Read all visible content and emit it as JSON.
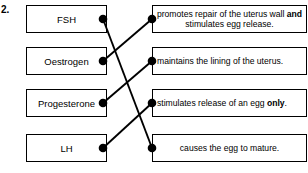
{
  "question": {
    "number": "2."
  },
  "left_boxes": [
    {
      "label": "FSH"
    },
    {
      "label": "Oestrogen"
    },
    {
      "label": "Progesterone"
    },
    {
      "label": "LH"
    }
  ],
  "right_boxes": [
    {
      "label_part1": "promotes repair of the uterus wall",
      "bold": "and",
      "label_part2": "stimulates egg release.",
      "align": "center"
    },
    {
      "label_part1": "maintains the lining of the uterus.",
      "bold": "",
      "label_part2": "",
      "align": "left"
    },
    {
      "label_part1": "stimulates release of an egg",
      "bold": "only",
      "label_part2": ".",
      "align": "left"
    },
    {
      "label_part1": "causes the egg to mature.",
      "bold": "",
      "label_part2": "",
      "align": "center"
    }
  ],
  "connections": [
    {
      "from": "FSH",
      "to": "causes the egg to mature.",
      "x1": 103,
      "y1": 19,
      "x2": 152,
      "y2": 148
    },
    {
      "from": "Oestrogen",
      "to": "promotes repair of the uterus wall and stimulates egg release.",
      "x1": 103,
      "y1": 61,
      "x2": 152,
      "y2": 19
    },
    {
      "from": "Progesterone",
      "to": "maintains the lining of the uterus.",
      "x1": 103,
      "y1": 103,
      "x2": 152,
      "y2": 61
    },
    {
      "from": "LH",
      "to": "stimulates release of an egg only.",
      "x1": 103,
      "y1": 148,
      "x2": 152,
      "y2": 103
    }
  ],
  "nodes": [
    {
      "name": "fsh-connector-dot",
      "cx": 103,
      "cy": 19
    },
    {
      "name": "oestrogen-connector-dot",
      "cx": 103,
      "cy": 61
    },
    {
      "name": "progesterone-connector-dot",
      "cx": 103,
      "cy": 103
    },
    {
      "name": "lh-connector-dot",
      "cx": 103,
      "cy": 148
    },
    {
      "name": "uterus-wall-repair-connector-dot",
      "cx": 152,
      "cy": 19
    },
    {
      "name": "maintains-lining-connector-dot",
      "cx": 152,
      "cy": 61
    },
    {
      "name": "egg-release-only-connector-dot",
      "cx": 152,
      "cy": 103
    },
    {
      "name": "egg-mature-connector-dot",
      "cx": 152,
      "cy": 148
    }
  ],
  "colors": {
    "line": "#000000",
    "box_border": "#000000",
    "background": "#ffffff",
    "text": "#000000"
  }
}
